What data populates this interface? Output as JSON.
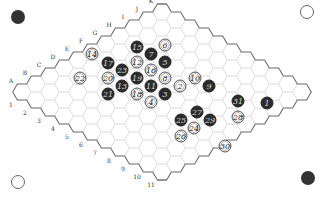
{
  "board": {
    "size": 11,
    "origin": [
      22,
      92
    ],
    "col_step": [
      14,
      -8
    ],
    "row_step": [
      14,
      8
    ],
    "cell_line_color": "#dcdcdc",
    "edge_color": "#777777",
    "column_labels": [
      "A",
      "B",
      "C",
      "D",
      "E",
      "F",
      "G",
      "H",
      "I",
      "J",
      "K"
    ],
    "row_labels": [
      "1",
      "2",
      "3",
      "4",
      "5",
      "6",
      "7",
      "8",
      "9",
      "10",
      "11"
    ]
  },
  "corners": [
    {
      "name": "top-left-black-marker",
      "color": "black",
      "x": 18,
      "y": 17
    },
    {
      "name": "top-right-white-marker",
      "color": "white",
      "x": 307,
      "y": 12
    },
    {
      "name": "bottom-left-white-marker",
      "color": "white",
      "x": 18,
      "y": 182
    },
    {
      "name": "bottom-right-black-marker",
      "color": "black",
      "x": 308,
      "y": 178
    }
  ],
  "stones": [
    {
      "n": "1",
      "color": "black",
      "x": 267,
      "y": 103
    },
    {
      "n": "2",
      "color": "white",
      "x": 180,
      "y": 86
    },
    {
      "n": "3",
      "color": "black",
      "x": 165,
      "y": 94
    },
    {
      "n": "4",
      "color": "white",
      "x": 151,
      "y": 102
    },
    {
      "n": "5",
      "color": "black",
      "x": 165,
      "y": 62
    },
    {
      "n": "6",
      "color": "white",
      "x": 165,
      "y": 45
    },
    {
      "n": "7",
      "color": "black",
      "x": 151,
      "y": 54
    },
    {
      "n": "8",
      "color": "white",
      "x": 165,
      "y": 78
    },
    {
      "n": "9",
      "color": "black",
      "x": 209,
      "y": 86
    },
    {
      "n": "10",
      "color": "white",
      "x": 195,
      "y": 78
    },
    {
      "n": "11",
      "color": "black",
      "x": 151,
      "y": 86
    },
    {
      "n": "12",
      "color": "white",
      "x": 137,
      "y": 62
    },
    {
      "n": "13",
      "color": "black",
      "x": 122,
      "y": 86
    },
    {
      "n": "14",
      "color": "white",
      "x": 92,
      "y": 54
    },
    {
      "n": "15",
      "color": "black",
      "x": 137,
      "y": 47
    },
    {
      "n": "16",
      "color": "white",
      "x": 151,
      "y": 70
    },
    {
      "n": "17",
      "color": "black",
      "x": 108,
      "y": 63
    },
    {
      "n": "18",
      "color": "white",
      "x": 137,
      "y": 94
    },
    {
      "n": "19",
      "color": "black",
      "x": 137,
      "y": 78
    },
    {
      "n": "20",
      "color": "white",
      "x": 108,
      "y": 78
    },
    {
      "n": "21",
      "color": "black",
      "x": 108,
      "y": 94
    },
    {
      "n": "22",
      "color": "white",
      "x": 80,
      "y": 78
    },
    {
      "n": "23",
      "color": "black",
      "x": 122,
      "y": 70
    },
    {
      "n": "24",
      "color": "white",
      "x": 194,
      "y": 128
    },
    {
      "n": "25",
      "color": "black",
      "x": 181,
      "y": 120
    },
    {
      "n": "26",
      "color": "white",
      "x": 181,
      "y": 136
    },
    {
      "n": "27",
      "color": "black",
      "x": 197,
      "y": 112
    },
    {
      "n": "28",
      "color": "white",
      "x": 238,
      "y": 117
    },
    {
      "n": "29",
      "color": "black",
      "x": 210,
      "y": 120
    },
    {
      "n": "30",
      "color": "white",
      "x": 225,
      "y": 146
    },
    {
      "n": "31",
      "color": "black",
      "x": 238,
      "y": 101
    }
  ]
}
